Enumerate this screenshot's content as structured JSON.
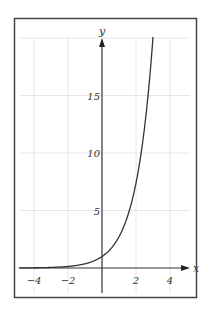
{
  "chart_data": {
    "type": "line",
    "title": "",
    "xlabel": "x",
    "ylabel": "y",
    "xlim": [
      -5,
      5.5
    ],
    "ylim": [
      -2,
      20
    ],
    "grid": true,
    "x_ticks": [
      -4,
      -2,
      2,
      4
    ],
    "x_tick_labels": [
      "−4",
      "−2",
      "2",
      "4"
    ],
    "y_ticks": [
      5,
      10,
      15
    ],
    "y_tick_labels": [
      "5",
      "10",
      "15"
    ],
    "function": "y = e^x",
    "series": [
      {
        "name": "y = e^x",
        "x": [
          -5,
          -4,
          -3,
          -2,
          -1,
          0,
          0.5,
          1,
          1.5,
          2,
          2.5,
          3
        ],
        "values": [
          0.007,
          0.018,
          0.05,
          0.14,
          0.37,
          1,
          1.65,
          2.72,
          4.48,
          7.39,
          12.18,
          20.09
        ]
      }
    ],
    "colors": {
      "curve": "#333333",
      "axes": "#333333",
      "grid": "#e6e6e6",
      "frame": "#444444"
    }
  }
}
